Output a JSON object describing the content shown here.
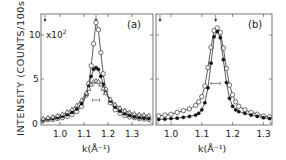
{
  "chart_data": [
    {
      "type": "scatter",
      "panel_label": "(a)",
      "title": "",
      "xlabel": "k (Å⁻¹)",
      "ylabel": "INTENSITY (COUNTS/100s)",
      "y_multiplier": "x10²",
      "xlim": [
        0.92,
        1.385
      ],
      "ylim": [
        0,
        11.5
      ],
      "x_ticks": [
        "1.0",
        "1.1",
        "1.2",
        "1.3"
      ],
      "y_ticks": [
        "0",
        "5",
        "10"
      ],
      "peak_marker_k": 1.15,
      "resolution_bar_k": [
        1.135,
        1.165
      ],
      "resolution_bar_y": 2.6,
      "series": [
        {
          "name": "open circles",
          "marker": "open-circle",
          "x": [
            0.93,
            0.95,
            0.97,
            0.99,
            1.01,
            1.03,
            1.05,
            1.07,
            1.09,
            1.11,
            1.12,
            1.13,
            1.14,
            1.15,
            1.16,
            1.17,
            1.18,
            1.19,
            1.21,
            1.23,
            1.25,
            1.27,
            1.29,
            1.31,
            1.33,
            1.35,
            1.37
          ],
          "y": [
            0.3,
            0.35,
            0.4,
            0.5,
            0.6,
            0.75,
            0.95,
            1.3,
            1.9,
            3.2,
            4.5,
            6.5,
            9.0,
            11.4,
            10.6,
            8.0,
            5.6,
            3.8,
            2.3,
            1.5,
            1.1,
            0.85,
            0.7,
            0.6,
            0.5,
            0.45,
            0.4
          ]
        },
        {
          "name": "filled circles",
          "marker": "filled-circle",
          "x": [
            0.93,
            0.95,
            0.97,
            0.99,
            1.01,
            1.03,
            1.05,
            1.07,
            1.09,
            1.11,
            1.12,
            1.13,
            1.14,
            1.15,
            1.16,
            1.17,
            1.18,
            1.19,
            1.21,
            1.23,
            1.25,
            1.27,
            1.29,
            1.31,
            1.33,
            1.35,
            1.37
          ],
          "y": [
            0.35,
            0.45,
            0.5,
            0.6,
            0.75,
            0.95,
            1.2,
            1.6,
            2.2,
            3.3,
            4.2,
            5.3,
            6.1,
            6.3,
            6.1,
            5.3,
            4.4,
            3.5,
            2.5,
            1.8,
            1.35,
            1.05,
            0.85,
            0.7,
            0.6,
            0.55,
            0.5
          ]
        },
        {
          "name": "open triangles",
          "marker": "open-triangle",
          "x": [
            0.93,
            0.95,
            0.97,
            0.99,
            1.01,
            1.03,
            1.05,
            1.07,
            1.09,
            1.11,
            1.12,
            1.13,
            1.14,
            1.15,
            1.16,
            1.17,
            1.18,
            1.19,
            1.21,
            1.23,
            1.25,
            1.27,
            1.29,
            1.31,
            1.33,
            1.35,
            1.37
          ],
          "y": [
            0.5,
            0.6,
            0.7,
            0.85,
            1.0,
            1.25,
            1.55,
            2.0,
            2.6,
            3.4,
            3.9,
            4.4,
            4.7,
            4.8,
            4.7,
            4.4,
            3.9,
            3.4,
            2.7,
            2.1,
            1.7,
            1.4,
            1.2,
            1.05,
            0.95,
            0.9,
            0.85
          ]
        }
      ]
    },
    {
      "type": "scatter",
      "panel_label": "(b)",
      "title": "",
      "xlabel": "k (Å⁻¹)",
      "ylabel": "",
      "xlim": [
        0.95,
        1.325
      ],
      "ylim": [
        0,
        11.5
      ],
      "x_ticks": [
        "1.0",
        "1.1",
        "1.2",
        "1.3"
      ],
      "peak_marker_k": 1.145,
      "edge_marker_k": 0.955,
      "resolution_bar_k": [
        1.13,
        1.16
      ],
      "resolution_bar_y": 4.5,
      "series": [
        {
          "name": "open circles",
          "marker": "open-circle",
          "x": [
            0.96,
            0.98,
            1.0,
            1.02,
            1.04,
            1.06,
            1.08,
            1.09,
            1.1,
            1.11,
            1.12,
            1.13,
            1.14,
            1.15,
            1.16,
            1.17,
            1.18,
            1.19,
            1.2,
            1.21,
            1.22,
            1.24,
            1.26,
            1.28,
            1.3,
            1.32
          ],
          "y": [
            0.8,
            0.9,
            1.0,
            1.2,
            1.4,
            1.6,
            2.0,
            2.4,
            3.0,
            4.2,
            6.3,
            8.6,
            10.5,
            10.8,
            10.3,
            8.5,
            6.2,
            4.3,
            3.2,
            2.4,
            1.9,
            1.5,
            1.2,
            1.0,
            0.8,
            0.7
          ]
        },
        {
          "name": "filled circles",
          "marker": "filled-circle",
          "x": [
            0.96,
            0.98,
            1.0,
            1.02,
            1.04,
            1.06,
            1.08,
            1.09,
            1.1,
            1.11,
            1.12,
            1.13,
            1.14,
            1.15,
            1.16,
            1.17,
            1.18,
            1.19,
            1.2,
            1.21,
            1.22,
            1.24,
            1.26,
            1.28,
            1.3,
            1.32
          ],
          "y": [
            0.4,
            0.45,
            0.5,
            0.55,
            0.65,
            0.75,
            0.9,
            1.1,
            1.5,
            2.3,
            4.0,
            6.8,
            9.8,
            10.4,
            9.7,
            7.2,
            4.6,
            2.8,
            1.9,
            1.5,
            1.3,
            1.1,
            0.9,
            0.75,
            0.6,
            0.5
          ]
        }
      ]
    }
  ],
  "labels": {
    "y_axis": "INTENSITY (COUNTS/100s)",
    "multiplier": "x10",
    "multiplier_exp": "2",
    "panel_a": "(a)",
    "panel_b": "(b)",
    "x_axis_a": "k(Å⁻¹)",
    "x_axis_b": "k(Å⁻¹)",
    "ytick_0": "0",
    "ytick_5": "5",
    "ytick_10": "10"
  }
}
